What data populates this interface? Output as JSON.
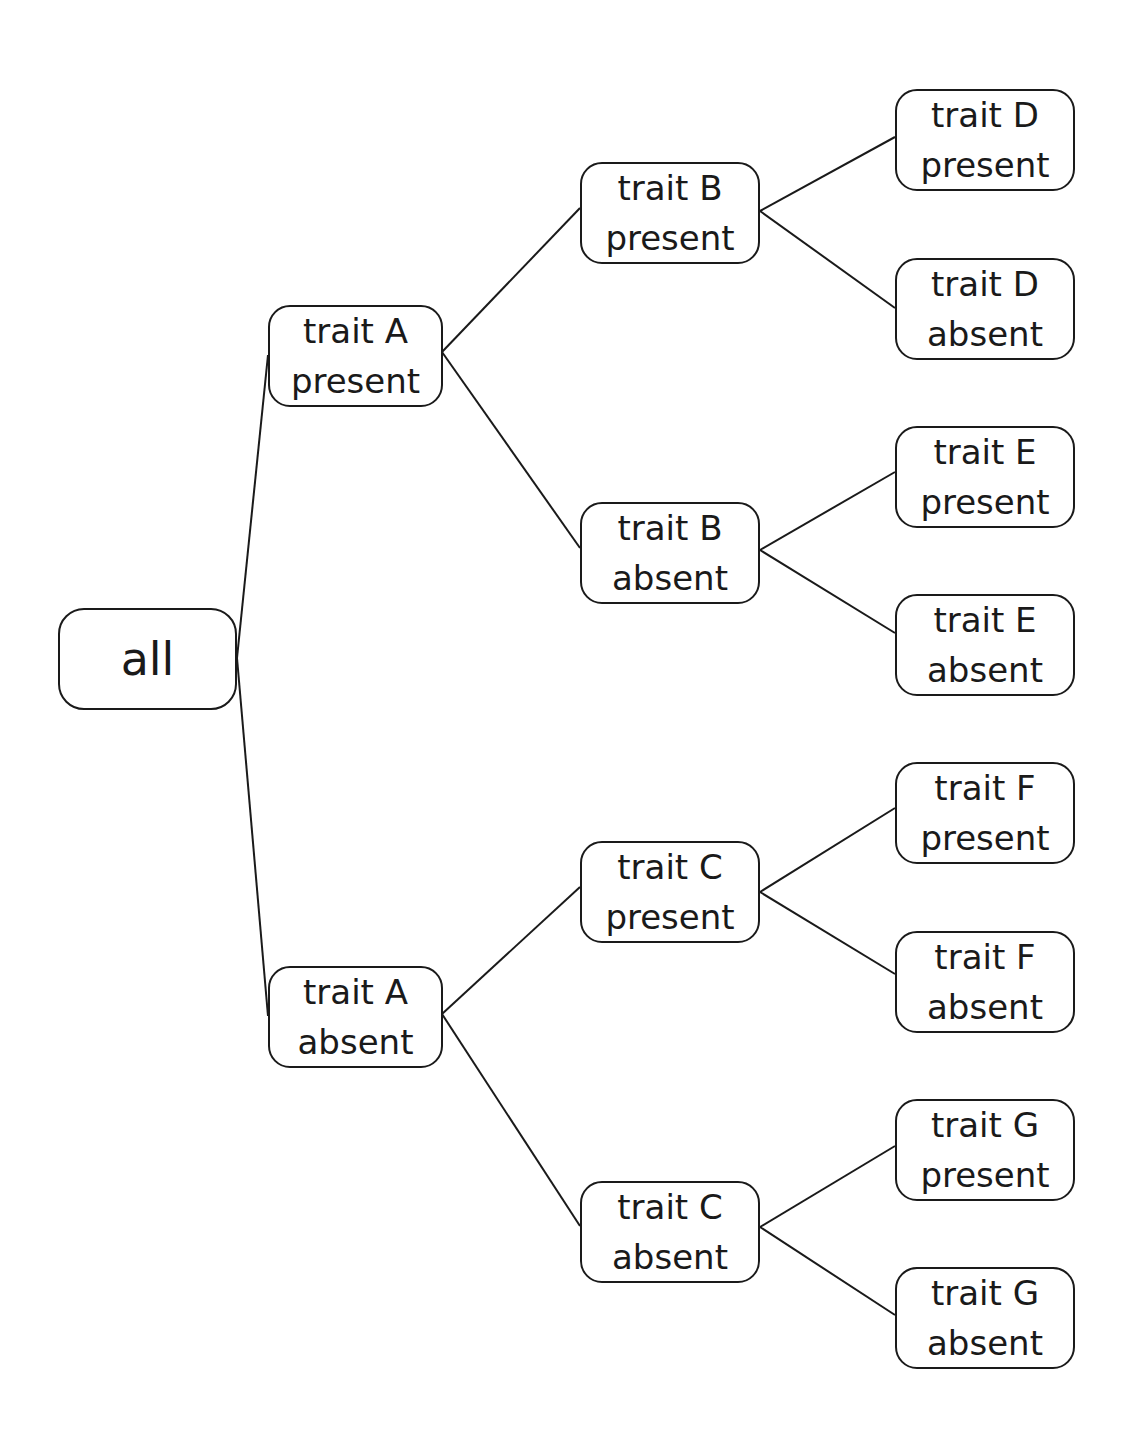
{
  "diagram": {
    "type": "tree",
    "orientation": "left-to-right",
    "colors": {
      "stroke": "#1a1a1a",
      "background": "#ffffff",
      "text": "#1a1a1a"
    },
    "nodes": {
      "root": {
        "lines": [
          "all"
        ]
      },
      "a_present": {
        "lines": [
          "trait A",
          "present"
        ]
      },
      "a_absent": {
        "lines": [
          "trait A",
          "absent"
        ]
      },
      "b_present": {
        "lines": [
          "trait B",
          "present"
        ]
      },
      "b_absent": {
        "lines": [
          "trait B",
          "absent"
        ]
      },
      "c_present": {
        "lines": [
          "trait C",
          "present"
        ]
      },
      "c_absent": {
        "lines": [
          "trait C",
          "absent"
        ]
      },
      "d_present": {
        "lines": [
          "trait D",
          "present"
        ]
      },
      "d_absent": {
        "lines": [
          "trait D",
          "absent"
        ]
      },
      "e_present": {
        "lines": [
          "trait E",
          "present"
        ]
      },
      "e_absent": {
        "lines": [
          "trait E",
          "absent"
        ]
      },
      "f_present": {
        "lines": [
          "trait F",
          "present"
        ]
      },
      "f_absent": {
        "lines": [
          "trait F",
          "absent"
        ]
      },
      "g_present": {
        "lines": [
          "trait G",
          "present"
        ]
      },
      "g_absent": {
        "lines": [
          "trait G",
          "absent"
        ]
      }
    },
    "edges": [
      [
        "root",
        "a_present"
      ],
      [
        "root",
        "a_absent"
      ],
      [
        "a_present",
        "b_present"
      ],
      [
        "a_present",
        "b_absent"
      ],
      [
        "a_absent",
        "c_present"
      ],
      [
        "a_absent",
        "c_absent"
      ],
      [
        "b_present",
        "d_present"
      ],
      [
        "b_present",
        "d_absent"
      ],
      [
        "b_absent",
        "e_present"
      ],
      [
        "b_absent",
        "e_absent"
      ],
      [
        "c_present",
        "f_present"
      ],
      [
        "c_present",
        "f_absent"
      ],
      [
        "c_absent",
        "g_present"
      ],
      [
        "c_absent",
        "g_absent"
      ]
    ]
  }
}
